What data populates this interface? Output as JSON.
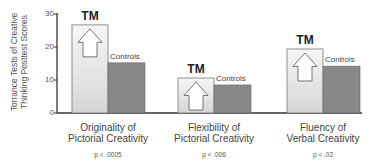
{
  "chart_data": {
    "type": "bar",
    "title": "",
    "ylabel": "Torrance Tests of Creative Thinking Posttest Scores",
    "ylabel_lines": [
      "Torrance Tests of Creative",
      "Thinking Posttest Scores"
    ],
    "xlabel": "",
    "ylim": [
      0,
      30
    ],
    "yticks": [
      0,
      10,
      20,
      30
    ],
    "grid": false,
    "legend": "inline bar labels",
    "categories": [
      {
        "name": "Originality of Pictorial Creativity",
        "lines": [
          "Originality of",
          "Pictorial Creativity"
        ],
        "p_value": "p < .0005"
      },
      {
        "name": "Flexibility of Pictorial Creativity",
        "lines": [
          "Flexibility of",
          "Pictorial Creativity"
        ],
        "p_value": "p < .006"
      },
      {
        "name": "Fluency of Verbal Creativity",
        "lines": [
          "Fluency of",
          "Verbal Creativity"
        ],
        "p_value": "p < .02"
      }
    ],
    "series": [
      {
        "name": "TM",
        "values": [
          26.7,
          10.6,
          19.4
        ],
        "color": "#e4e4e4"
      },
      {
        "name": "Controls",
        "values": [
          15.2,
          8.5,
          14.2
        ],
        "color": "#888888"
      }
    ]
  },
  "labels": {
    "tm": "TM",
    "controls": "Controls",
    "ticks": [
      "0",
      "10",
      "20",
      "30"
    ]
  }
}
